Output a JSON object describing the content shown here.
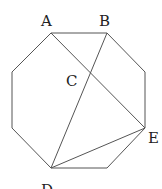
{
  "figure": {
    "type": "regular-octagon-with-diagonals",
    "points": {
      "A": {
        "label": "A",
        "x": 51,
        "y": 33,
        "lx": 41,
        "ly": 26
      },
      "B": {
        "label": "B",
        "x": 107,
        "y": 33,
        "lx": 99,
        "ly": 26
      },
      "C": {
        "label": "C",
        "x": 90,
        "y": 74,
        "lx": 66,
        "ly": 86
      },
      "D": {
        "label": "D",
        "x": 51,
        "y": 168,
        "lx": 41,
        "ly": 195
      },
      "E": {
        "label": "E",
        "x": 145,
        "y": 128,
        "lx": 148,
        "ly": 143
      }
    },
    "octagon_vertices": [
      [
        51,
        33
      ],
      [
        107,
        33
      ],
      [
        145,
        72
      ],
      [
        145,
        128
      ],
      [
        107,
        168
      ],
      [
        51,
        168
      ],
      [
        12,
        128
      ],
      [
        12,
        72
      ]
    ],
    "segments": [
      [
        "A",
        "E"
      ],
      [
        "B",
        "D"
      ],
      [
        "D",
        "E"
      ]
    ],
    "stroke_color": "#555555"
  }
}
